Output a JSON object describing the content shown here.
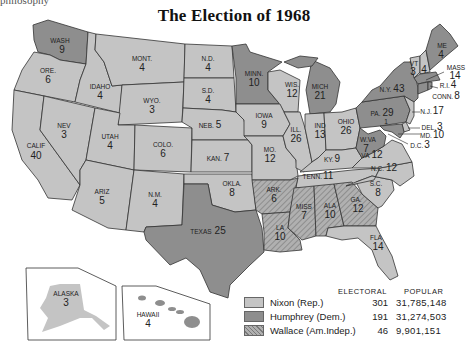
{
  "page": {
    "fragment_text": "philosophy",
    "title": "The Election of 1968"
  },
  "colors": {
    "nixon": "#c4c4c4",
    "humphrey": "#8e8e8e",
    "wallace": "#a4a4a4",
    "water": "#ffffff",
    "border": "#333333"
  },
  "legend": {
    "col_electoral": "ELECTORAL",
    "col_popular": "POPULAR",
    "rows": [
      {
        "name": "Nixon (Rep.)",
        "electoral": "301",
        "popular": "31,785,148",
        "pattern": "nixon"
      },
      {
        "name": "Humphrey (Dem.)",
        "electoral": "191",
        "popular": "31,274,503",
        "pattern": "humphrey"
      },
      {
        "name": "Wallace (Am.Indep.)",
        "electoral": "46",
        "popular": "9,901,151",
        "pattern": "wallace"
      }
    ]
  },
  "states": {
    "wa": {
      "name": "WASH",
      "ev": "9",
      "winner": "humphrey"
    },
    "or": {
      "name": "ORE.",
      "ev": "6",
      "winner": "nixon"
    },
    "ca": {
      "name": "CALIF",
      "ev": "40",
      "winner": "nixon"
    },
    "id": {
      "name": "IDAHO",
      "ev": "4",
      "winner": "nixon"
    },
    "nv": {
      "name": "NEV",
      "ev": "3",
      "winner": "nixon"
    },
    "mt": {
      "name": "MONT.",
      "ev": "4",
      "winner": "nixon"
    },
    "wy": {
      "name": "WYO.",
      "ev": "3",
      "winner": "nixon"
    },
    "ut": {
      "name": "UTAH",
      "ev": "4",
      "winner": "nixon"
    },
    "az": {
      "name": "ARIZ",
      "ev": "5",
      "winner": "nixon"
    },
    "co": {
      "name": "COLO.",
      "ev": "6",
      "winner": "nixon"
    },
    "nm": {
      "name": "N.M.",
      "ev": "4",
      "winner": "nixon"
    },
    "nd": {
      "name": "N.D.",
      "ev": "4",
      "winner": "nixon"
    },
    "sd": {
      "name": "S.D.",
      "ev": "4",
      "winner": "nixon"
    },
    "ne": {
      "name": "NEB.",
      "ev": "5",
      "winner": "nixon"
    },
    "ks": {
      "name": "KAN.",
      "ev": "7",
      "winner": "nixon"
    },
    "ok": {
      "name": "OKLA.",
      "ev": "8",
      "winner": "nixon"
    },
    "tx": {
      "name": "TEXAS",
      "ev": "25",
      "winner": "humphrey"
    },
    "mn": {
      "name": "MINN.",
      "ev": "10",
      "winner": "humphrey"
    },
    "ia": {
      "name": "IOWA",
      "ev": "9",
      "winner": "nixon"
    },
    "mo": {
      "name": "MO.",
      "ev": "12",
      "winner": "nixon"
    },
    "ar": {
      "name": "ARK.",
      "ev": "6",
      "winner": "wallace"
    },
    "la": {
      "name": "LA",
      "ev": "10",
      "winner": "wallace"
    },
    "wi": {
      "name": "WIS.",
      "ev": "12",
      "winner": "nixon"
    },
    "il": {
      "name": "ILL.",
      "ev": "26",
      "winner": "nixon"
    },
    "mi": {
      "name": "MICH",
      "ev": "21",
      "winner": "humphrey"
    },
    "in": {
      "name": "IND",
      "ev": "13",
      "winner": "nixon"
    },
    "oh": {
      "name": "OHIO",
      "ev": "26",
      "winner": "nixon"
    },
    "ky": {
      "name": "KY.",
      "ev": "9",
      "winner": "nixon"
    },
    "tn": {
      "name": "TENN.",
      "ev": "11",
      "winner": "nixon"
    },
    "ms": {
      "name": "MISS",
      "ev": "7",
      "winner": "wallace"
    },
    "al": {
      "name": "ALA",
      "ev": "10",
      "winner": "wallace"
    },
    "ga": {
      "name": "GA.",
      "ev": "12",
      "winner": "wallace"
    },
    "fl": {
      "name": "FLA",
      "ev": "14",
      "winner": "nixon"
    },
    "sc": {
      "name": "S.C.",
      "ev": "8",
      "winner": "nixon"
    },
    "nc": {
      "name": "N.C.",
      "ev": "12",
      "winner": "nixon"
    },
    "va": {
      "name": "VA",
      "ev": "12",
      "winner": "nixon"
    },
    "wv": {
      "name": "W.VA",
      "ev": "7",
      "winner": "humphrey"
    },
    "pa": {
      "name": "PA.",
      "ev": "29",
      "winner": "humphrey"
    },
    "ny": {
      "name": "N.Y.",
      "ev": "43",
      "winner": "humphrey"
    },
    "vt": {
      "name": "VT",
      "ev": "3",
      "winner": "nixon"
    },
    "nh": {
      "name": "N.H.",
      "ev": "4",
      "winner": "nixon"
    },
    "me": {
      "name": "ME",
      "ev": "4",
      "winner": "humphrey"
    },
    "ma": {
      "name": "MASS",
      "ev": "14",
      "winner": "humphrey"
    },
    "ri": {
      "name": "R.I.",
      "ev": "4",
      "winner": "humphrey"
    },
    "ct": {
      "name": "CONN.",
      "ev": "8",
      "winner": "humphrey"
    },
    "nj": {
      "name": "N.J.",
      "ev": "17",
      "winner": "nixon"
    },
    "de": {
      "name": "DEL.",
      "ev": "3",
      "winner": "nixon"
    },
    "md": {
      "name": "MD.",
      "ev": "10",
      "winner": "humphrey"
    },
    "dc": {
      "name": "D.C.",
      "ev": "3",
      "winner": "humphrey"
    },
    "ak": {
      "name": "ALASKA",
      "ev": "3",
      "winner": "nixon"
    },
    "hi": {
      "name": "HAWAII",
      "ev": "4",
      "winner": "humphrey"
    },
    "split_nc_note": "1"
  },
  "insets": {
    "alaska_label": "ALASKA",
    "hawaii_label": "HAWAII"
  }
}
